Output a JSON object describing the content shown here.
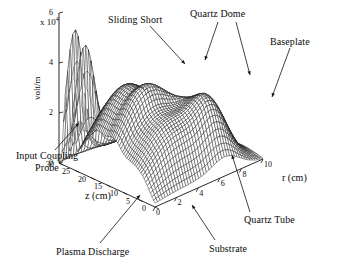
{
  "figure": {
    "name": "3d-surface-electric-field",
    "background": "#ffffff",
    "line_color": "#111111"
  },
  "axes": {
    "y": {
      "label": "volt/m",
      "exponent_prefix": "x 10",
      "exponent": "4",
      "ticks": [
        "0",
        "2",
        "4",
        "6"
      ],
      "tick_values": [
        0,
        2,
        4,
        6
      ],
      "range": [
        0,
        6
      ]
    },
    "z": {
      "label": "z (cm)",
      "ticks": [
        "30",
        "25",
        "20",
        "15",
        "10",
        "5",
        "0"
      ],
      "tick_values": [
        30,
        25,
        20,
        15,
        10,
        5,
        0
      ],
      "range": [
        0,
        30
      ]
    },
    "r": {
      "label": "r (cm)",
      "ticks": [
        "0",
        "2",
        "4",
        "6",
        "8",
        "10"
      ],
      "tick_values": [
        0,
        2,
        4,
        6,
        8,
        10
      ],
      "range": [
        0,
        10
      ]
    }
  },
  "annotations": [
    {
      "id": "sliding-short",
      "text": "Sliding Short"
    },
    {
      "id": "quartz-dome",
      "text": "Quartz Dome"
    },
    {
      "id": "baseplate",
      "text": "Baseplate"
    },
    {
      "id": "input-coupling-probe",
      "text": "Input Coupling Probe"
    },
    {
      "id": "plasma-discharge",
      "text": "Plasma Discharge"
    },
    {
      "id": "substrate",
      "text": "Substrate"
    },
    {
      "id": "quartz-tube",
      "text": "Quartz Tube"
    }
  ],
  "chart_data": {
    "type": "surface",
    "title": "",
    "xlabel": "z (cm)",
    "ylabel": "r (cm)",
    "zlabel": "volt/m",
    "z_exponent": 4,
    "grid": false,
    "legend": null,
    "xlim": [
      0,
      30
    ],
    "ylim": [
      0,
      10
    ],
    "zlim": [
      0,
      6
    ],
    "x": [
      0,
      1,
      2,
      3,
      4,
      5,
      6,
      7,
      8,
      9,
      10,
      11,
      12,
      13,
      14,
      15,
      16,
      17,
      18,
      19,
      20,
      21,
      22,
      23,
      24,
      25,
      26,
      27,
      28,
      29,
      30
    ],
    "y": [
      0,
      0.5,
      1,
      1.5,
      2,
      2.5,
      3,
      3.5,
      4,
      4.5,
      5,
      5.5,
      6,
      6.5,
      7,
      7.5,
      8,
      8.5,
      9,
      9.5,
      10
    ],
    "peaks": [
      {
        "name": "input-probe-spike-1",
        "z": 28.0,
        "r": 0.9,
        "amplitude": 5.2,
        "sigma_z": 0.55,
        "sigma_r": 0.8
      },
      {
        "name": "input-probe-spike-2",
        "z": 25.6,
        "r": 1.1,
        "amplitude": 4.3,
        "sigma_z": 0.55,
        "sigma_r": 0.9
      },
      {
        "name": "sliding-short-ridge",
        "z": 19.0,
        "r": 2.6,
        "amplitude": 3.0,
        "sigma_z": 3.6,
        "sigma_r": 2.6
      },
      {
        "name": "quartz-dome-ridge",
        "z": 12.0,
        "r": 3.0,
        "amplitude": 2.6,
        "sigma_z": 3.2,
        "sigma_r": 2.8
      },
      {
        "name": "plasma-ridge",
        "z": 5.5,
        "r": 3.2,
        "amplitude": 2.0,
        "sigma_z": 2.8,
        "sigma_r": 2.8
      },
      {
        "name": "quartz-tube-bump",
        "z": 4.0,
        "r": 6.6,
        "amplitude": 1.5,
        "sigma_z": 3.0,
        "sigma_r": 1.3
      },
      {
        "name": "baseplate-bump",
        "z": 9.5,
        "r": 6.8,
        "amplitude": 1.1,
        "sigma_z": 3.0,
        "sigma_r": 1.2
      }
    ]
  }
}
